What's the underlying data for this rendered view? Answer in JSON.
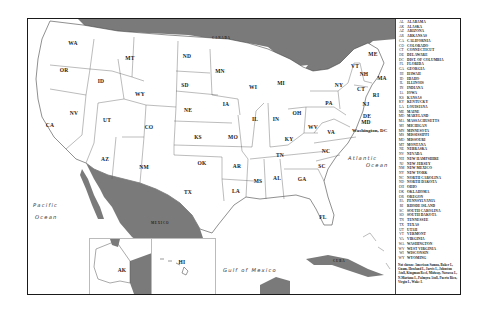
{
  "map": {
    "title_implied": "United States",
    "colors": {
      "foreign_land": "#7a7a7a",
      "us_land": "#ffffff",
      "border": "#555555",
      "frame": "#1a1a1a"
    },
    "countries": [
      {
        "id": "canada",
        "label": "CANADA"
      },
      {
        "id": "mexico",
        "label": "MEXICO"
      },
      {
        "id": "cuba",
        "label": "CUBA"
      }
    ],
    "water_bodies": [
      {
        "id": "pacific",
        "line1": "Pacific",
        "line2": "Ocean"
      },
      {
        "id": "atlantic",
        "line1": "Atlantic",
        "line2": "Ocean"
      },
      {
        "id": "gulf",
        "line1": "Gulf of Mexico"
      }
    ],
    "capital_label": "Washington, DC",
    "states": [
      {
        "abbr": "WA",
        "x": 45,
        "y": 24
      },
      {
        "abbr": "OR",
        "x": 36,
        "y": 51
      },
      {
        "abbr": "CA",
        "x": 22,
        "y": 106
      },
      {
        "abbr": "NV",
        "x": 46,
        "y": 94
      },
      {
        "abbr": "ID",
        "x": 73,
        "y": 62
      },
      {
        "abbr": "MT",
        "x": 102,
        "y": 39
      },
      {
        "abbr": "WY",
        "x": 112,
        "y": 75
      },
      {
        "abbr": "UT",
        "x": 79,
        "y": 101
      },
      {
        "abbr": "CO",
        "x": 121,
        "y": 108
      },
      {
        "abbr": "AZ",
        "x": 77,
        "y": 140
      },
      {
        "abbr": "NM",
        "x": 116,
        "y": 148
      },
      {
        "abbr": "ND",
        "x": 159,
        "y": 37
      },
      {
        "abbr": "SD",
        "x": 157,
        "y": 66
      },
      {
        "abbr": "NE",
        "x": 160,
        "y": 91
      },
      {
        "abbr": "KS",
        "x": 170,
        "y": 118
      },
      {
        "abbr": "OK",
        "x": 174,
        "y": 144
      },
      {
        "abbr": "TX",
        "x": 160,
        "y": 173
      },
      {
        "abbr": "MN",
        "x": 192,
        "y": 52
      },
      {
        "abbr": "IA",
        "x": 198,
        "y": 85
      },
      {
        "abbr": "MO",
        "x": 205,
        "y": 118
      },
      {
        "abbr": "AR",
        "x": 209,
        "y": 147
      },
      {
        "abbr": "LA",
        "x": 208,
        "y": 172
      },
      {
        "abbr": "WI",
        "x": 225,
        "y": 68
      },
      {
        "abbr": "IL",
        "x": 227,
        "y": 100
      },
      {
        "abbr": "MS",
        "x": 230,
        "y": 162
      },
      {
        "abbr": "MI",
        "x": 253,
        "y": 64
      },
      {
        "abbr": "IN",
        "x": 248,
        "y": 100
      },
      {
        "abbr": "KY",
        "x": 261,
        "y": 120
      },
      {
        "abbr": "TN",
        "x": 252,
        "y": 136
      },
      {
        "abbr": "AL",
        "x": 249,
        "y": 159
      },
      {
        "abbr": "GA",
        "x": 274,
        "y": 160
      },
      {
        "abbr": "FL",
        "x": 295,
        "y": 198
      },
      {
        "abbr": "OH",
        "x": 269,
        "y": 94
      },
      {
        "abbr": "WV",
        "x": 285,
        "y": 108
      },
      {
        "abbr": "VA",
        "x": 303,
        "y": 113
      },
      {
        "abbr": "NC",
        "x": 298,
        "y": 132
      },
      {
        "abbr": "SC",
        "x": 294,
        "y": 147
      },
      {
        "abbr": "PA",
        "x": 301,
        "y": 84
      },
      {
        "abbr": "NY",
        "x": 311,
        "y": 66
      },
      {
        "abbr": "VT",
        "x": 327,
        "y": 47
      },
      {
        "abbr": "NH",
        "x": 336,
        "y": 55
      },
      {
        "abbr": "ME",
        "x": 345,
        "y": 35
      },
      {
        "abbr": "MA",
        "x": 354,
        "y": 59
      },
      {
        "abbr": "CT",
        "x": 333,
        "y": 70
      },
      {
        "abbr": "RI",
        "x": 348,
        "y": 76
      },
      {
        "abbr": "NJ",
        "x": 338,
        "y": 85
      },
      {
        "abbr": "DE",
        "x": 339,
        "y": 97
      },
      {
        "abbr": "MD",
        "x": 338,
        "y": 103
      }
    ],
    "inset": {
      "alaska_label": "AK",
      "hawaii_label": "HI"
    }
  },
  "legend": {
    "entries": [
      {
        "abbr": "AL",
        "name": "ALABAMA"
      },
      {
        "abbr": "AK",
        "name": "ALASKA"
      },
      {
        "abbr": "AZ",
        "name": "ARIZONA"
      },
      {
        "abbr": "AR",
        "name": "ARKANSAS"
      },
      {
        "abbr": "CA",
        "name": "CALIFORNIA"
      },
      {
        "abbr": "CO",
        "name": "COLORADO"
      },
      {
        "abbr": "CT",
        "name": "CONNECTICUT"
      },
      {
        "abbr": "DE",
        "name": "DELAWARE"
      },
      {
        "abbr": "DC",
        "name": "DIST. OF COLUMBIA"
      },
      {
        "abbr": "FL",
        "name": "FLORIDA"
      },
      {
        "abbr": "GA",
        "name": "GEORGIA"
      },
      {
        "abbr": "HI",
        "name": "HAWAII"
      },
      {
        "abbr": "ID",
        "name": "IDAHO"
      },
      {
        "abbr": "IL",
        "name": "ILLINOIS"
      },
      {
        "abbr": "IN",
        "name": "INDIANA"
      },
      {
        "abbr": "IA",
        "name": "IOWA"
      },
      {
        "abbr": "KS",
        "name": "KANSAS"
      },
      {
        "abbr": "KY",
        "name": "KENTUCKY"
      },
      {
        "abbr": "LA",
        "name": "LOUISIANA"
      },
      {
        "abbr": "ME",
        "name": "MAINE"
      },
      {
        "abbr": "MD",
        "name": "MARYLAND"
      },
      {
        "abbr": "MA",
        "name": "MASSACHUSETTS"
      },
      {
        "abbr": "MI",
        "name": "MICHIGAN"
      },
      {
        "abbr": "MN",
        "name": "MINNESOTA"
      },
      {
        "abbr": "MS",
        "name": "MISSISSIPPI"
      },
      {
        "abbr": "MO",
        "name": "MISSOURI"
      },
      {
        "abbr": "MT",
        "name": "MONTANA"
      },
      {
        "abbr": "NE",
        "name": "NEBRASKA"
      },
      {
        "abbr": "NV",
        "name": "NEVADA"
      },
      {
        "abbr": "NH",
        "name": "NEW HAMPSHIRE"
      },
      {
        "abbr": "NJ",
        "name": "NEW JERSEY"
      },
      {
        "abbr": "NM",
        "name": "NEW MEXICO"
      },
      {
        "abbr": "NY",
        "name": "NEW YORK"
      },
      {
        "abbr": "NC",
        "name": "NORTH CAROLINA"
      },
      {
        "abbr": "ND",
        "name": "NORTH DAKOTA"
      },
      {
        "abbr": "OH",
        "name": "OHIO"
      },
      {
        "abbr": "OK",
        "name": "OKLAHOMA"
      },
      {
        "abbr": "OR",
        "name": "OREGON"
      },
      {
        "abbr": "PA",
        "name": "PENNSYLVANIA"
      },
      {
        "abbr": "RI",
        "name": "RHODE ISLAND"
      },
      {
        "abbr": "SC",
        "name": "SOUTH CAROLINA"
      },
      {
        "abbr": "SD",
        "name": "SOUTH DAKOTA"
      },
      {
        "abbr": "TN",
        "name": "TENNESSEE"
      },
      {
        "abbr": "TX",
        "name": "TEXAS"
      },
      {
        "abbr": "UT",
        "name": "UTAH"
      },
      {
        "abbr": "VT",
        "name": "VERMONT"
      },
      {
        "abbr": "VA",
        "name": "VIRGINIA"
      },
      {
        "abbr": "WA",
        "name": "WASHINGTON"
      },
      {
        "abbr": "WV",
        "name": "WEST VIRGINIA"
      },
      {
        "abbr": "WI",
        "name": "WISCONSIN"
      },
      {
        "abbr": "WY",
        "name": "WYOMING"
      }
    ],
    "note": "Not shown: American Samoa, Baker I., Guam, Howland I., Jarvis I., Johnston Atoll, Kingman Reef, Midway, Navassa I., N.Mariana I., Palmyra Atoll, Puerto Rico, Virgin I., Wake I."
  }
}
